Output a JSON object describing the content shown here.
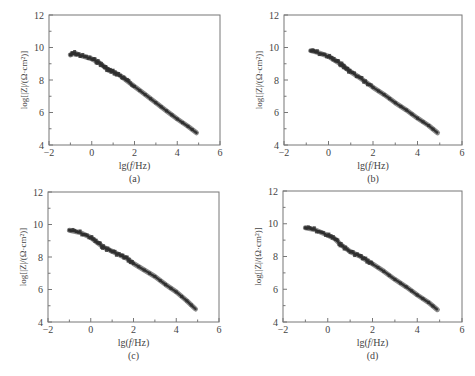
{
  "figure": {
    "panels": [
      "(a)",
      "(b)",
      "(c)",
      "(d)"
    ]
  },
  "axis_labels": {
    "x": "lg(f/Hz)",
    "y": "log[|Z|/(Ω·cm²)]"
  },
  "chart_data": [
    {
      "type": "line",
      "panel": "(a)",
      "title": "",
      "xlabel": "lg(f/Hz)",
      "ylabel": "log[|Z|/(Ω·cm²)]",
      "xlim": [
        -2,
        6
      ],
      "ylim": [
        4,
        12
      ],
      "xticks": [
        -2,
        0,
        2,
        4,
        6
      ],
      "yticks": [
        4,
        6,
        8,
        10,
        12
      ],
      "grid": false,
      "legend": null,
      "x": [
        -1.0,
        -0.8,
        -0.5,
        0.0,
        0.3,
        0.6,
        0.8,
        1.0,
        1.3,
        1.6,
        2.0,
        2.5,
        3.0,
        3.5,
        4.0,
        4.5,
        4.9
      ],
      "y": [
        9.55,
        9.65,
        9.5,
        9.3,
        9.1,
        8.8,
        8.6,
        8.5,
        8.3,
        8.0,
        7.6,
        7.1,
        6.6,
        6.1,
        5.6,
        5.15,
        4.75
      ],
      "color": "#333333"
    },
    {
      "type": "line",
      "panel": "(b)",
      "title": "",
      "xlabel": "lg(f/Hz)",
      "ylabel": "log[|Z|/(Ω·cm²)]",
      "xlim": [
        -2,
        6
      ],
      "ylim": [
        4,
        12
      ],
      "xticks": [
        -2,
        0,
        2,
        4,
        6
      ],
      "yticks": [
        4,
        6,
        8,
        10,
        12
      ],
      "grid": false,
      "legend": null,
      "x": [
        -0.8,
        -0.5,
        0.0,
        0.3,
        0.6,
        0.8,
        1.0,
        1.5,
        2.0,
        2.5,
        3.0,
        3.5,
        4.0,
        4.5,
        4.9
      ],
      "y": [
        9.8,
        9.7,
        9.45,
        9.2,
        8.95,
        8.7,
        8.5,
        8.05,
        7.55,
        7.1,
        6.6,
        6.15,
        5.65,
        5.2,
        4.75
      ],
      "color": "#333333"
    },
    {
      "type": "line",
      "panel": "(c)",
      "title": "",
      "xlabel": "lg(f/Hz)",
      "ylabel": "log[|Z|/(Ω·cm²)]",
      "xlim": [
        -2,
        6
      ],
      "ylim": [
        4,
        12
      ],
      "xticks": [
        -2,
        0,
        2,
        4,
        6
      ],
      "yticks": [
        4,
        6,
        8,
        10,
        12
      ],
      "grid": false,
      "legend": null,
      "x": [
        -1.0,
        -0.5,
        0.0,
        0.3,
        0.6,
        1.0,
        1.4,
        1.7,
        2.0,
        2.5,
        3.0,
        3.5,
        4.0,
        4.5,
        4.9
      ],
      "y": [
        9.65,
        9.5,
        9.2,
        8.9,
        8.6,
        8.35,
        8.1,
        7.9,
        7.6,
        7.2,
        6.8,
        6.3,
        5.85,
        5.3,
        4.8
      ],
      "color": "#333333"
    },
    {
      "type": "line",
      "panel": "(d)",
      "title": "",
      "xlabel": "lg(f/Hz)",
      "ylabel": "log[|Z|/(Ω·cm²)]",
      "xlim": [
        -2,
        6
      ],
      "ylim": [
        4,
        12
      ],
      "xticks": [
        -2,
        0,
        2,
        4,
        6
      ],
      "yticks": [
        4,
        6,
        8,
        10,
        12
      ],
      "grid": false,
      "legend": null,
      "x": [
        -1.0,
        -0.6,
        0.0,
        0.3,
        0.6,
        1.0,
        1.4,
        1.7,
        2.0,
        2.5,
        3.0,
        3.5,
        4.0,
        4.5,
        4.9
      ],
      "y": [
        9.75,
        9.65,
        9.3,
        9.1,
        8.7,
        8.3,
        8.05,
        7.8,
        7.55,
        7.1,
        6.6,
        6.15,
        5.65,
        5.2,
        4.75
      ],
      "color": "#333333"
    }
  ]
}
